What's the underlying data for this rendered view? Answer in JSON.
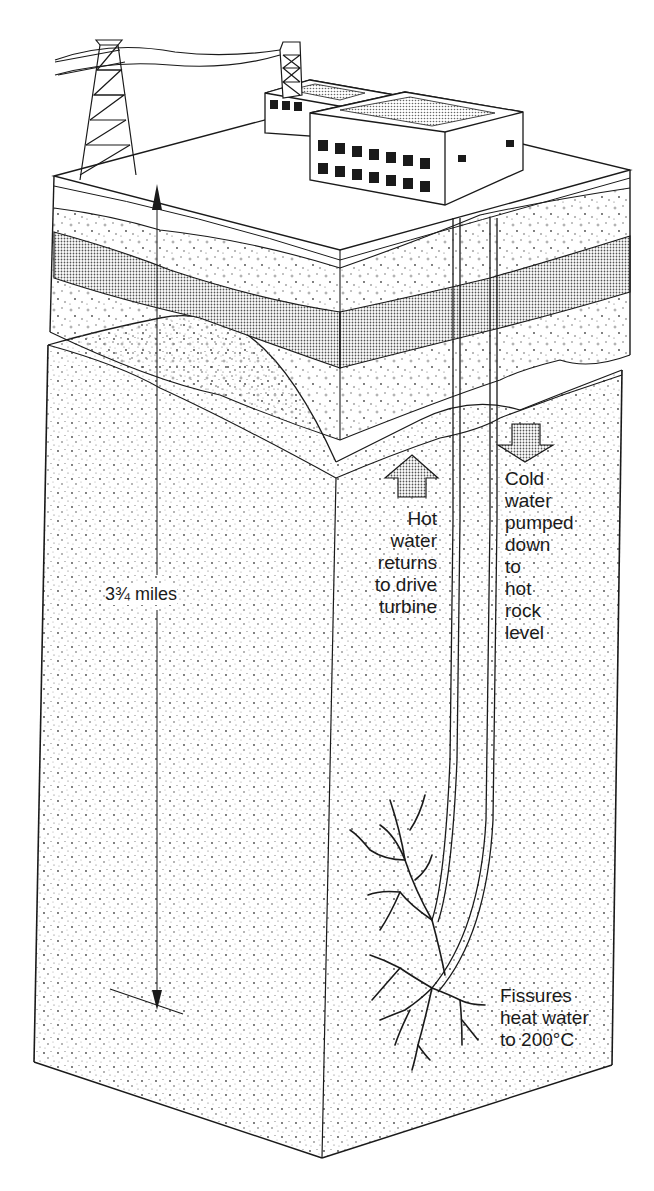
{
  "diagram": {
    "labels": {
      "depth": "3¾ miles",
      "hot_water": "Hot\nwater\nreturns\nto drive\nturbine",
      "cold_water": "Cold\nwater\npumped\ndown\nto\nhot\nrock\nlevel",
      "fissures": "Fissures\nheat water\nto 200°C"
    },
    "elements": {
      "pylon": "electricity-pylon-icon",
      "power_station": "power-station-building",
      "injection_well": "cold-water-injection-pipe",
      "production_well": "hot-water-return-pipe",
      "arrow_up": "hot-water-up-arrow",
      "arrow_down": "cold-water-down-arrow",
      "strata": [
        "topsoil",
        "sediment-layer",
        "dense-shaded-layer",
        "sediment-layer",
        "hot-rock-basement"
      ]
    },
    "colors": {
      "ink": "#1a1a1a",
      "paper": "#ffffff",
      "stipple": "#555555"
    }
  }
}
